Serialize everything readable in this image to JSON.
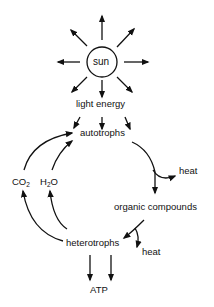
{
  "diagram": {
    "sun_label": "sun",
    "light_energy": "light energy",
    "autotrophs": "autotrophs",
    "heat_top": "heat",
    "organic_compounds": "organic compounds",
    "heterotrophs": "heterotrophs",
    "heat_bottom": "heat",
    "atp": "ATP",
    "co2": {
      "base": "CO",
      "sub": "2"
    },
    "h2o": {
      "pre": "H",
      "sub": "2",
      "post": "O"
    }
  },
  "colors": {
    "stroke": "#111111",
    "background": "#ffffff"
  }
}
